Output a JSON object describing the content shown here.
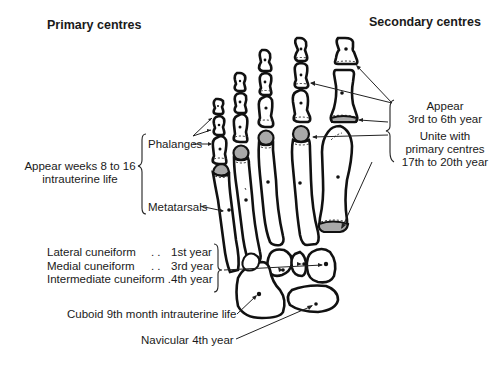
{
  "headers": {
    "primary": "Primary centres",
    "secondary": "Secondary centres"
  },
  "left_labels": {
    "appear_line1": "Appear weeks 8 to 16",
    "appear_line2": "intrauterine life",
    "phalanges": "Phalanges",
    "metatarsals": "Metatarsals"
  },
  "cuneiforms": [
    {
      "name": "Lateral cuneiform",
      "dots": ". .",
      "age": "1st year"
    },
    {
      "name": "Medial cuneiform",
      "dots": ". .",
      "age": "3rd year"
    },
    {
      "name": "Intermediate cuneiform",
      "dots": ".",
      "age": "4th year"
    }
  ],
  "cuboid": "Cuboid 9th month intrauterine life",
  "navicular": "Navicular 4th year",
  "right_labels": {
    "appear_line1": "Appear",
    "appear_line2": "3rd to 6th year",
    "unite_line1": "Unite with",
    "unite_line2": "primary centres",
    "unite_line3": "17th to 20th year"
  },
  "colors": {
    "bone_outline": "#111111",
    "epiphysis_fill": "#a9a9a9",
    "background": "#ffffff"
  }
}
